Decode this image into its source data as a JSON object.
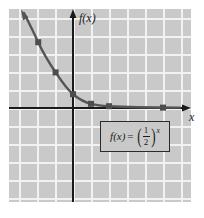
{
  "figure": {
    "background_color": "#ffffff",
    "plot_background_color": "#c9c9c9",
    "grid_color": "#f2f2f2",
    "axis_color": "#1a1a1a",
    "curve_color": "#555555"
  },
  "labels": {
    "y_axis": "f(x)",
    "x_axis": "x"
  },
  "formula": {
    "lhs": "f(x)",
    "equals": "=",
    "numerator": "1",
    "denominator": "2",
    "exponent": "x",
    "full_text": "f(x) = (1/2)^x"
  },
  "chart_data": {
    "type": "line",
    "title": "",
    "xlabel": "x",
    "ylabel": "f(x)",
    "function": "f(x) = (1/2)^x",
    "xlim": [
      -3.6,
      6.5
    ],
    "ylim": [
      -5.5,
      5.5
    ],
    "grid": true,
    "legend": false,
    "gridline_spacing": 1,
    "series": [
      {
        "name": "f(x) = (1/2)^x",
        "marker": "square",
        "x": [
          -3,
          -2,
          -1,
          0,
          1,
          2,
          5
        ],
        "y": [
          8,
          4,
          2,
          1,
          0.5,
          0.25,
          0.03125
        ],
        "marked_points": [
          {
            "x": -2,
            "y": 4
          },
          {
            "x": -1,
            "y": 2
          },
          {
            "x": 0,
            "y": 1
          },
          {
            "x": 1,
            "y": 0.5
          },
          {
            "x": 2,
            "y": 0.25
          },
          {
            "x": 5,
            "y": 0.03125
          }
        ]
      }
    ],
    "annotations": [
      {
        "text": "f(x) = (1/2)^x",
        "x": 2.5,
        "y": -1.5,
        "boxed": true
      }
    ]
  }
}
